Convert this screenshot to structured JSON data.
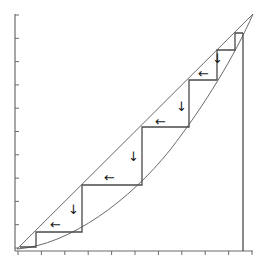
{
  "diagram": {
    "type": "cobweb-staircase",
    "colors": {
      "axis": "#6a6a6a",
      "lines": "#4a4a4a",
      "arrows": "#1a1a1a",
      "background": "#ffffff"
    },
    "axes": {
      "x_ticks": 11,
      "y_ticks": 11,
      "x_tick_labels": [],
      "y_tick_labels": []
    },
    "arrow_glyphs": {
      "left": "←",
      "down": "↓"
    },
    "arrows": [
      {
        "dir": "left",
        "x": 50,
        "y": 229
      },
      {
        "dir": "down",
        "x": 68,
        "y": 214
      },
      {
        "dir": "left",
        "x": 104,
        "y": 182
      },
      {
        "dir": "down",
        "x": 128,
        "y": 161
      },
      {
        "dir": "left",
        "x": 155,
        "y": 126
      },
      {
        "dir": "down",
        "x": 176,
        "y": 111
      },
      {
        "dir": "left",
        "x": 198,
        "y": 78
      },
      {
        "dir": "down",
        "x": 212,
        "y": 63
      }
    ],
    "step_points": [
      [
        20,
        247
      ],
      [
        36,
        247
      ],
      [
        36,
        232
      ],
      [
        82,
        232
      ],
      [
        82,
        185
      ],
      [
        142,
        185
      ],
      [
        142,
        127
      ],
      [
        189,
        127
      ],
      [
        189,
        80
      ],
      [
        217,
        80
      ],
      [
        217,
        50
      ],
      [
        235,
        50
      ],
      [
        235,
        33
      ],
      [
        243,
        33
      ]
    ]
  }
}
